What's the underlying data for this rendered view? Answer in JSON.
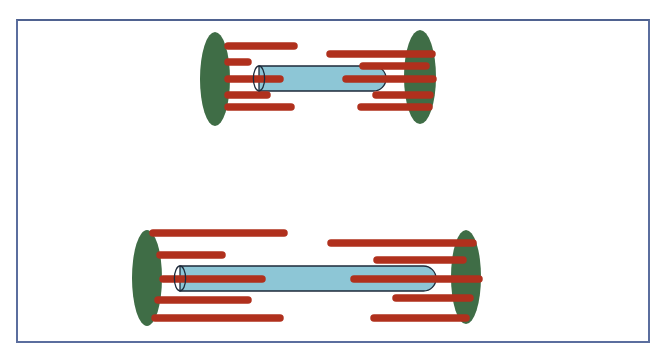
{
  "figure": {
    "title": "",
    "colors": {
      "frame": "#5b6e9e",
      "pole": "#3f6d46",
      "fiber": "#b0301d",
      "tube": "#8dc6d6",
      "tube_outline": "#1e2a3a"
    },
    "structures": [
      {
        "name": "short-spindle",
        "left_pole": {
          "cx": 215,
          "cy": 79,
          "rx": 15,
          "ry": 47
        },
        "right_pole": {
          "cx": 420,
          "cy": 77,
          "rx": 16,
          "ry": 47
        },
        "tube": {
          "x1": 259,
          "x2": 386,
          "y_top": 66,
          "y_bottom": 91
        },
        "left_fibers": [
          {
            "y": 46,
            "x1": 228,
            "x2": 294
          },
          {
            "y": 62,
            "x1": 228,
            "x2": 248
          },
          {
            "y": 79,
            "x1": 228,
            "x2": 280
          },
          {
            "y": 95,
            "x1": 228,
            "x2": 267
          },
          {
            "y": 107,
            "x1": 228,
            "x2": 291
          }
        ],
        "right_fibers": [
          {
            "y": 54,
            "x1": 330,
            "x2": 432
          },
          {
            "y": 66,
            "x1": 363,
            "x2": 426
          },
          {
            "y": 79,
            "x1": 346,
            "x2": 433
          },
          {
            "y": 95,
            "x1": 376,
            "x2": 430
          },
          {
            "y": 107,
            "x1": 361,
            "x2": 429
          }
        ]
      },
      {
        "name": "elongated-spindle",
        "left_pole": {
          "cx": 147,
          "cy": 278,
          "rx": 15,
          "ry": 48
        },
        "right_pole": {
          "cx": 466,
          "cy": 277,
          "rx": 15,
          "ry": 47
        },
        "tube": {
          "x1": 180,
          "x2": 436,
          "y_top": 266,
          "y_bottom": 291
        },
        "left_fibers": [
          {
            "y": 233,
            "x1": 153,
            "x2": 284
          },
          {
            "y": 255,
            "x1": 160,
            "x2": 222
          },
          {
            "y": 279,
            "x1": 163,
            "x2": 262
          },
          {
            "y": 300,
            "x1": 158,
            "x2": 248
          },
          {
            "y": 318,
            "x1": 155,
            "x2": 280
          }
        ],
        "right_fibers": [
          {
            "y": 243,
            "x1": 331,
            "x2": 473
          },
          {
            "y": 260,
            "x1": 377,
            "x2": 463
          },
          {
            "y": 279,
            "x1": 354,
            "x2": 479
          },
          {
            "y": 298,
            "x1": 396,
            "x2": 470
          },
          {
            "y": 318,
            "x1": 374,
            "x2": 466
          }
        ]
      }
    ]
  }
}
